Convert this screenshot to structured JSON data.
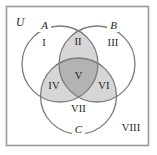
{
  "figure": {
    "type": "venn-diagram-three-sets",
    "universe_label": "U",
    "frame": {
      "border_color": "#9a9a9a",
      "background_color": "#ffffff",
      "x": 6,
      "y": 6,
      "width": 143,
      "height": 140
    },
    "palette": {
      "outline": "#7c7c7c",
      "text": "#231f20",
      "shade_pair": "#d6d6d6",
      "shade_triple": "#b3b3b3",
      "unshaded": "#ffffff"
    },
    "sets": [
      {
        "id": "A",
        "label": "A",
        "cx": 60,
        "cy": 64,
        "r": 38,
        "label_x": 44,
        "label_y": 26
      },
      {
        "id": "B",
        "label": "B",
        "cx": 97,
        "cy": 64,
        "r": 38,
        "label_x": 113,
        "label_y": 26
      },
      {
        "id": "C",
        "label": "C",
        "cx": 78.5,
        "cy": 96,
        "r": 38,
        "label_x": 78,
        "label_y": 130
      }
    ],
    "regions": [
      {
        "id": "I",
        "label": "I",
        "membership": "A only",
        "shade": "none",
        "x": 44,
        "y": 44
      },
      {
        "id": "II",
        "label": "II",
        "membership": "A and B",
        "shade": "light",
        "x": 78,
        "y": 43
      },
      {
        "id": "III",
        "label": "III",
        "membership": "B only",
        "shade": "none",
        "x": 113,
        "y": 44
      },
      {
        "id": "IV",
        "label": "IV",
        "membership": "A and C",
        "shade": "light",
        "x": 54,
        "y": 87
      },
      {
        "id": "V",
        "label": "V",
        "membership": "A and B and C",
        "shade": "dark",
        "x": 78,
        "y": 77
      },
      {
        "id": "VI",
        "label": "VI",
        "membership": "B and C",
        "shade": "light",
        "x": 104,
        "y": 87
      },
      {
        "id": "VII",
        "label": "VII",
        "membership": "C only",
        "shade": "none",
        "x": 78,
        "y": 110
      },
      {
        "id": "VIII",
        "label": "VIII",
        "membership": "outside all sets",
        "shade": "none",
        "x": 131,
        "y": 130
      }
    ]
  }
}
